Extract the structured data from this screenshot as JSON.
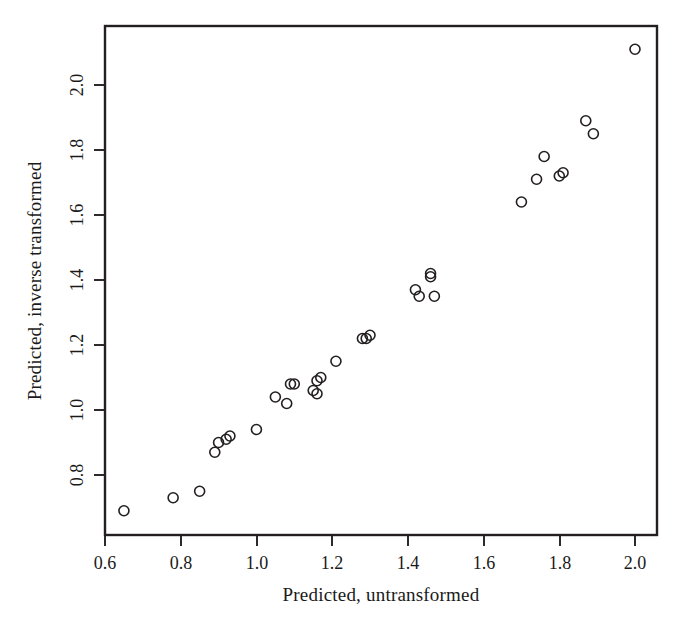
{
  "chart_data": {
    "type": "scatter",
    "title": "",
    "xlabel": "Predicted, untransformed",
    "ylabel": "Predicted, inverse transformed",
    "xlim": [
      0.55,
      2.06
    ],
    "ylim": [
      0.69,
      2.16
    ],
    "xticks": [
      0.6,
      0.8,
      1.0,
      1.2,
      1.4,
      1.6,
      1.8,
      2.0
    ],
    "xtick_labels": [
      "0.6",
      "0.8",
      "1.0",
      "1.2",
      "1.4",
      "1.6",
      "1.8",
      "2.0"
    ],
    "yticks": [
      0.8,
      1.0,
      1.2,
      1.4,
      1.6,
      1.8,
      2.0
    ],
    "ytick_labels": [
      "0.8",
      "1.0",
      "1.2",
      "1.4",
      "1.6",
      "1.8",
      "2.0"
    ],
    "grid": false,
    "legend": false,
    "marker": "open-circle",
    "marker_radius_px": 5,
    "x": [
      0.65,
      0.78,
      0.85,
      0.89,
      0.9,
      0.92,
      0.93,
      1.0,
      1.05,
      1.08,
      1.09,
      1.1,
      1.15,
      1.16,
      1.16,
      1.17,
      1.21,
      1.28,
      1.29,
      1.3,
      1.42,
      1.43,
      1.46,
      1.46,
      1.47,
      1.7,
      1.74,
      1.76,
      1.8,
      1.81,
      1.87,
      1.89,
      2.0
    ],
    "y": [
      0.69,
      0.73,
      0.75,
      0.87,
      0.9,
      0.91,
      0.92,
      0.94,
      1.04,
      1.02,
      1.08,
      1.08,
      1.06,
      1.05,
      1.09,
      1.1,
      1.15,
      1.22,
      1.22,
      1.23,
      1.37,
      1.35,
      1.41,
      1.42,
      1.35,
      1.64,
      1.71,
      1.78,
      1.72,
      1.73,
      1.89,
      1.85,
      2.11
    ]
  }
}
